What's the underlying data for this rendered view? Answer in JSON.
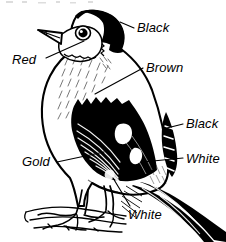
{
  "diagram": {
    "ink_color": "#000000",
    "background_color": "#ffffff",
    "labels": [
      {
        "id": "black-head",
        "text": "Black",
        "target": "head-cap"
      },
      {
        "id": "red",
        "text": "Red",
        "target": "face-mask"
      },
      {
        "id": "brown",
        "text": "Brown",
        "target": "breast"
      },
      {
        "id": "black-wing",
        "text": "Black",
        "target": "wing-tip"
      },
      {
        "id": "white-tail",
        "text": "White",
        "target": "tail-base-patch"
      },
      {
        "id": "gold",
        "text": "Gold",
        "target": "wing-bar"
      },
      {
        "id": "white-belly",
        "text": "White",
        "target": "belly-undertail"
      }
    ]
  }
}
